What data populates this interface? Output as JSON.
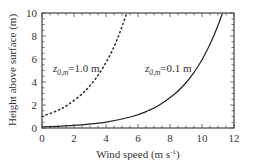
{
  "chart_data": {
    "type": "line",
    "title": "",
    "xlabel": "Wind speed (m s⁻¹)",
    "xlabel_parts": {
      "main": "Wind speed (m s",
      "sup": "-1",
      "close": ")"
    },
    "ylabel": "Height above surface (m)",
    "xlim": [
      0,
      12
    ],
    "ylim": [
      0,
      10
    ],
    "xticks": [
      0,
      2,
      4,
      6,
      8,
      10,
      12
    ],
    "yticks": [
      0,
      2,
      4,
      6,
      8,
      10
    ],
    "x_minor_step": 0.5,
    "y_minor_step": 0.5,
    "grid": false,
    "legend": "none (inline annotations)",
    "series": [
      {
        "name": "z0,m = 1.0 m",
        "style": "dotted",
        "color": "#333333",
        "x": [
          0.0,
          0.93,
          1.6,
          2.53,
          3.19,
          3.7,
          4.12,
          4.48,
          4.78,
          5.05,
          5.3
        ],
        "y": [
          1.0,
          1.5,
          2.0,
          3.0,
          4.0,
          5.0,
          6.0,
          7.0,
          8.0,
          9.0,
          10.0
        ]
      },
      {
        "name": "z0,m = 0.1 m",
        "style": "solid",
        "color": "#222222",
        "x": [
          0.0,
          1.7,
          3.94,
          5.64,
          6.63,
          7.34,
          8.33,
          9.04,
          9.58,
          10.03,
          10.4,
          10.73,
          11.02,
          11.28
        ],
        "y": [
          0.1,
          0.2,
          0.5,
          1.0,
          1.5,
          2.0,
          3.0,
          4.0,
          5.0,
          6.0,
          7.0,
          8.0,
          9.0,
          10.0
        ]
      }
    ],
    "annotations": [
      {
        "text_z": "z",
        "text_sub": "0,m",
        "text_val": "=1.0 m",
        "x": 0.5,
        "y": 4.7
      },
      {
        "text_z": "z",
        "text_sub": "0,m",
        "text_val": "=0.1 m",
        "x": 6.6,
        "y": 4.7
      }
    ]
  },
  "labels": {
    "ylabel": "Height above surface (m)",
    "xlabel_main": "Wind speed (m s",
    "xlabel_sup": "-1",
    "xlabel_close": ")",
    "annot1_z": "z",
    "annot1_sub": "0,m",
    "annot1_val": "=1.0 m",
    "annot2_z": "z",
    "annot2_sub": "0,m",
    "annot2_val": "=0.1 m"
  }
}
